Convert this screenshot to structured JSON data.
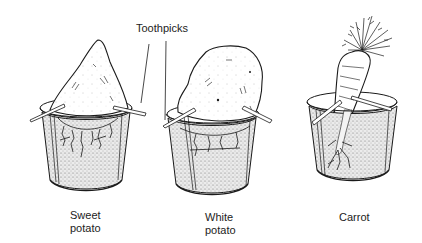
{
  "figure": {
    "callout": {
      "label": "Toothpicks"
    },
    "items": [
      {
        "id": "sweet-potato",
        "label_line1": "Sweet",
        "label_line2": "potato"
      },
      {
        "id": "white-potato",
        "label_line1": "White",
        "label_line2": "potato"
      },
      {
        "id": "carrot",
        "label_line1": "Carrot",
        "label_line2": ""
      }
    ],
    "colors": {
      "ink": "#1a1a1a",
      "water": "#d8d8d8",
      "background": "#ffffff"
    }
  }
}
